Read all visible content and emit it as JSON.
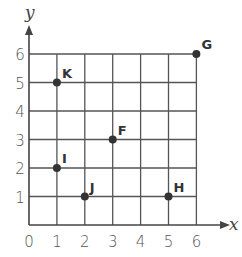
{
  "chart_data": {
    "type": "scatter",
    "title": "",
    "xlabel": "x",
    "ylabel": "y",
    "xlim": [
      0,
      6
    ],
    "ylim": [
      0,
      6
    ],
    "grid": true,
    "x_ticks": [
      "0",
      "1",
      "2",
      "3",
      "4",
      "5",
      "6"
    ],
    "y_ticks": [
      "1",
      "2",
      "3",
      "4",
      "5",
      "6"
    ],
    "points": [
      {
        "label": "K",
        "x": 1,
        "y": 5
      },
      {
        "label": "G",
        "x": 6,
        "y": 6
      },
      {
        "label": "F",
        "x": 3,
        "y": 3
      },
      {
        "label": "I",
        "x": 1,
        "y": 2
      },
      {
        "label": "J",
        "x": 2,
        "y": 1
      },
      {
        "label": "H",
        "x": 5,
        "y": 1
      }
    ],
    "colors": {
      "grid": "#555555",
      "point": "#333333"
    }
  }
}
